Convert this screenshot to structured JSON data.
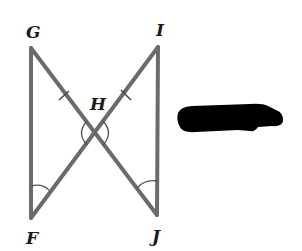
{
  "diagram": {
    "type": "geometry",
    "points": {
      "G": {
        "label": "G",
        "x": 31,
        "y": 48
      },
      "I": {
        "label": "I",
        "x": 158,
        "y": 47
      },
      "H": {
        "label": "H",
        "x": 95,
        "y": 133
      },
      "F": {
        "label": "F",
        "x": 31,
        "y": 218
      },
      "J": {
        "label": "J",
        "x": 157,
        "y": 215
      }
    },
    "segments": [
      {
        "from": "G",
        "to": "F"
      },
      {
        "from": "G",
        "to": "J"
      },
      {
        "from": "I",
        "to": "F"
      },
      {
        "from": "I",
        "to": "J"
      }
    ],
    "congruence_marks": [
      {
        "segment": "GH",
        "ticks": 1
      },
      {
        "segment": "IH",
        "ticks": 1
      }
    ],
    "angle_marks": [
      {
        "vertex": "H",
        "side": "left",
        "arcs": 1
      },
      {
        "vertex": "H",
        "side": "right",
        "arcs": 1
      },
      {
        "vertex": "F",
        "arcs": 1
      },
      {
        "vertex": "J",
        "arcs": 1
      }
    ],
    "redaction": {
      "present": true
    },
    "colors": {
      "line": "#6b6b6b",
      "label": "#1a1a1a",
      "redaction": "#000000"
    }
  }
}
